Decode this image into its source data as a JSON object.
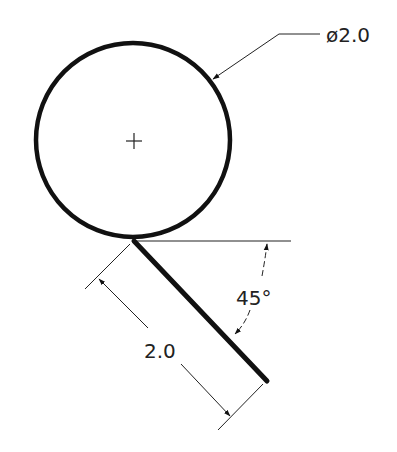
{
  "drawing": {
    "colors": {
      "line": "#111111",
      "text": "#222222",
      "background": "#ffffff"
    },
    "circle": {
      "cx": 133,
      "cy": 140,
      "r": 97,
      "stroke_width": 4.5
    },
    "center_mark": {
      "x": 134,
      "y": 141,
      "half_length": 8
    },
    "diameter_callout": {
      "label": "ø2.0",
      "leader_tip": [
        212,
        80
      ],
      "leader_bend": [
        279,
        34
      ],
      "leader_end": [
        320,
        34
      ],
      "text_pos": [
        326,
        42
      ]
    },
    "inclined_line": {
      "start": [
        134,
        241
      ],
      "end": [
        267,
        381
      ],
      "stroke_width": 5
    },
    "reference_line": {
      "start": [
        134,
        241
      ],
      "end": [
        291,
        241
      ]
    },
    "length_dimension": {
      "label": "2.0",
      "text_pos": [
        144,
        358
      ],
      "ext_line_1": [
        [
          130,
          244
        ],
        [
          85,
          289
        ]
      ],
      "ext_line_2": [
        [
          263,
          384
        ],
        [
          218,
          430
        ]
      ],
      "dim_line_a": [
        [
          98,
          278
        ],
        [
          148,
          328
        ]
      ],
      "dim_line_b": [
        [
          181,
          364
        ],
        [
          231,
          417
        ]
      ]
    },
    "angle_dimension": {
      "label": "45°",
      "text_pos": [
        236,
        305
      ],
      "arc_top": [
        [
          267,
          243
        ],
        [
          262,
          276
        ]
      ],
      "arc_bottom": [
        [
          250,
          310
        ],
        [
          234,
          335
        ]
      ]
    }
  }
}
